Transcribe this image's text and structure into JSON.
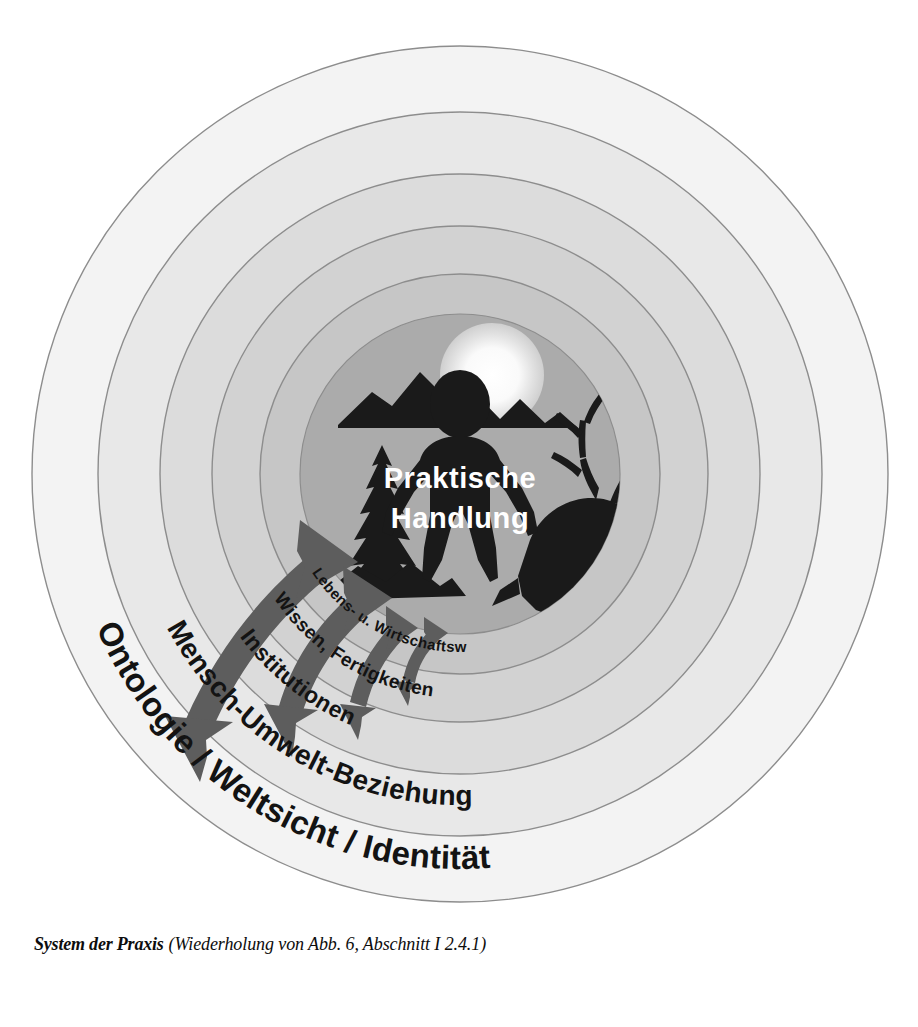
{
  "figure": {
    "caption_title": "System der Praxis",
    "caption_note": "(Wiederholung von Abb. 6, Abschnitt I 2.4.1)"
  },
  "diagram": {
    "type": "concentric-rings",
    "center_label_line1": "Praktische",
    "center_label_line2": "Handlung",
    "rings": [
      {
        "label": "Lebens- u. Wirtschaftsweise",
        "radius": 200,
        "fill": "#c6c6c6",
        "font_size": 15
      },
      {
        "label": "Wissen, Fertigkeiten",
        "radius": 248,
        "fill": "#d2d2d2",
        "font_size": 18
      },
      {
        "label": "Institutionen",
        "radius": 300,
        "fill": "#dcdcdc",
        "font_size": 22
      },
      {
        "label": "Mensch-Umwelt-Beziehung",
        "radius": 362,
        "fill": "#e8e8e8",
        "font_size": 27
      },
      {
        "label": "Ontologie / Weltsicht / Identität",
        "radius": 428,
        "fill": "#f3f3f3",
        "font_size": 32
      }
    ],
    "core": {
      "radius": 160,
      "fill": "#ababab"
    },
    "scene_icons": [
      "sun-icon",
      "mountains-icon",
      "human-figure-icon",
      "fir-tree-icon",
      "stag-head-icon"
    ],
    "arrows": {
      "count": 4,
      "style": "double-headed-curved",
      "color": "#5d5d5d"
    },
    "colors": {
      "ring_outline": "#8d8d8d",
      "silhouette": "#1a1a1a",
      "arrow": "#5d5d5d",
      "center_text": "#ffffff",
      "ring_text": "#131313",
      "background": "#ffffff"
    }
  }
}
